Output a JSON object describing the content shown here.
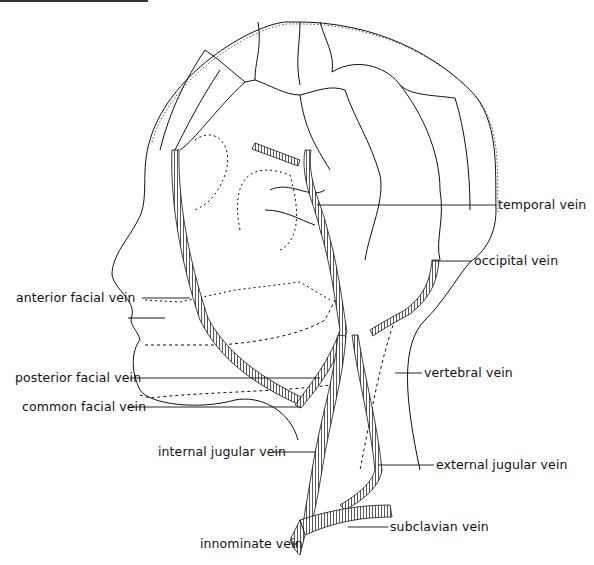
{
  "diagram": {
    "labels": [
      {
        "id": "temporal",
        "text": "temporal vein",
        "x": 498,
        "y": 199,
        "side": "right"
      },
      {
        "id": "occipital",
        "text": "occipital vein",
        "x": 474,
        "y": 255,
        "side": "right"
      },
      {
        "id": "anterior_facial",
        "text": "anterior facial vein",
        "x": 16,
        "y": 291,
        "side": "left"
      },
      {
        "id": "vertebral",
        "text": "vertebral vein",
        "x": 424,
        "y": 367,
        "side": "right"
      },
      {
        "id": "posterior_facial",
        "text": "posterior facial vein",
        "x": 15,
        "y": 372,
        "side": "left"
      },
      {
        "id": "common_facial",
        "text": "common facial vein",
        "x": 22,
        "y": 401,
        "side": "left"
      },
      {
        "id": "internal_jugular",
        "text": "internal jugular vein",
        "x": 158,
        "y": 445,
        "side": "left"
      },
      {
        "id": "external_jugular",
        "text": "external jugular vein",
        "x": 436,
        "y": 458,
        "side": "right"
      },
      {
        "id": "subclavian",
        "text": "subclavian vein",
        "x": 390,
        "y": 520,
        "side": "right"
      },
      {
        "id": "innominate",
        "text": "innominate vein",
        "x": 200,
        "y": 537,
        "side": "left"
      }
    ]
  }
}
